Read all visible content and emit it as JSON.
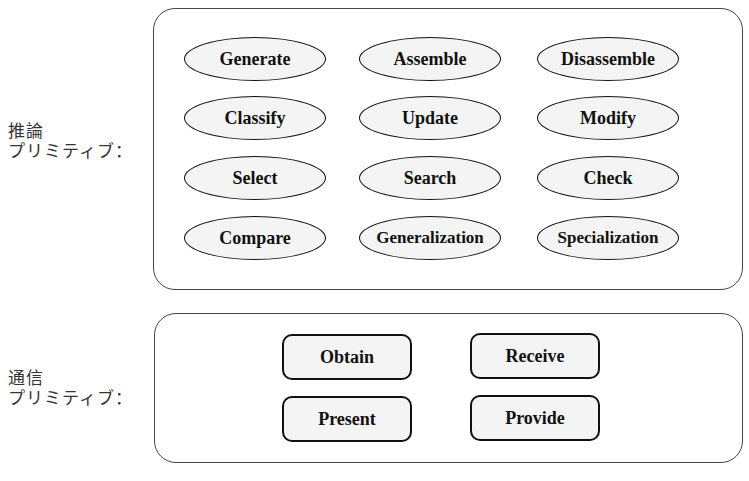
{
  "reasoning": {
    "label_line1": "推論",
    "label_line2": "プリミティブ：",
    "items": [
      "Generate",
      "Assemble",
      "Disassemble",
      "Classify",
      "Update",
      "Modify",
      "Select",
      "Search",
      "Check",
      "Compare",
      "Generalization",
      "Specialization"
    ]
  },
  "communication": {
    "label_line1": "通信",
    "label_line2": "プリミティブ：",
    "items": [
      "Obtain",
      "Receive",
      "Present",
      "Provide"
    ]
  }
}
